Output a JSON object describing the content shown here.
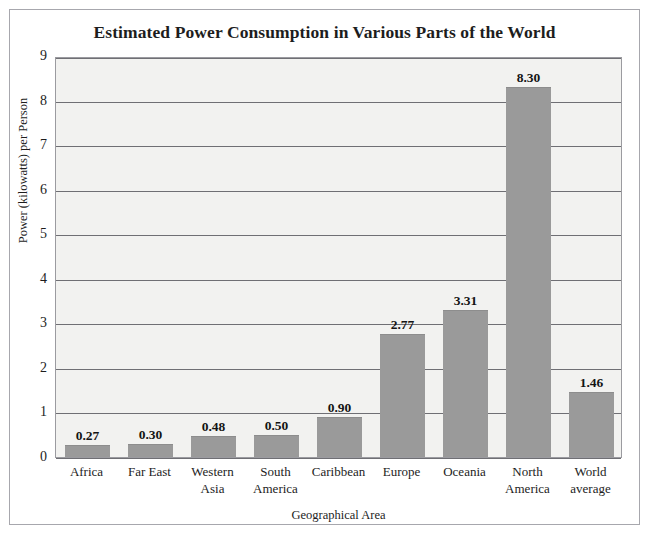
{
  "scan": {
    "top_sliver_text": ""
  },
  "chart_data": {
    "type": "bar",
    "title": "Estimated Power Consumption in Various Parts of the World",
    "xlabel": "Geographical Area",
    "ylabel": "Power (kilowatts) per Person",
    "categories": [
      "Africa",
      "Far East",
      "Western Asia",
      "South America",
      "Caribbean",
      "Europe",
      "Oceania",
      "North America",
      "World average"
    ],
    "category_lines": [
      [
        "Africa"
      ],
      [
        "Far East"
      ],
      [
        "Western",
        "Asia"
      ],
      [
        "South",
        "America"
      ],
      [
        "Caribbean"
      ],
      [
        "Europe"
      ],
      [
        "Oceania"
      ],
      [
        "North",
        "America"
      ],
      [
        "World",
        "average"
      ]
    ],
    "values": [
      0.27,
      0.3,
      0.48,
      0.5,
      0.9,
      2.77,
      3.31,
      8.3,
      1.46
    ],
    "value_labels": [
      "0.27",
      "0.30",
      "0.48",
      "0.50",
      "0.90",
      "2.77",
      "3.31",
      "8.30",
      "1.46"
    ],
    "ylim": [
      0,
      9
    ],
    "yticks": [
      0,
      1,
      2,
      3,
      4,
      5,
      6,
      7,
      8,
      9
    ],
    "ytick_labels": [
      "0",
      "1",
      "2",
      "3",
      "4",
      "5",
      "6",
      "7",
      "8",
      "9"
    ],
    "grid": true,
    "legend": false,
    "bar_color": "#9a9a9a",
    "plot_background": "#f2f2f0",
    "gridline_color": "#6f6f74",
    "frame_color": "#a7a7ad",
    "text_color": "#1d1d1d"
  }
}
